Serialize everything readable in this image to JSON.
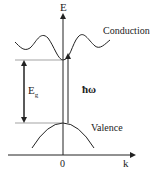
{
  "diagram": {
    "labels": {
      "energy_axis": "E",
      "k_axis": "k",
      "origin": "0",
      "conduction": "Conduction",
      "valence": "Valence",
      "gap_main": "E",
      "gap_sub": "g",
      "photon": "ħω"
    },
    "colors": {
      "line": "#222222",
      "background": "#ffffff"
    }
  }
}
